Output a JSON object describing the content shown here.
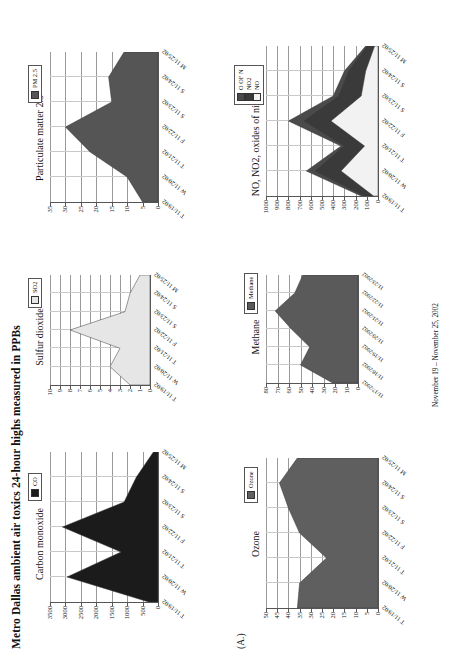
{
  "document": {
    "title": "Metro Dallas ambient air toxics 24-hour highs measured in PPBs",
    "panel_letter": "(A.)",
    "footer": "November 19 – November 25, 2002"
  },
  "colors": {
    "co_fill": "#1b1b1b",
    "so2_fill": "#e6e6e6",
    "ozone_fill": "#5f5f5f",
    "pm25_fill": "#555555",
    "methane_fill": "#5a5a5a",
    "methane_band": "#d9d9d9",
    "nox_o_of_n": "#4a4a4a",
    "nox_no2": "#3a3a3a",
    "nox_no": "#f2f2f2",
    "axis": "#555555",
    "grid": "#9a9a9a"
  },
  "dates_short": [
    "T 11/19/02",
    "W 11/20/02",
    "T 11/21/02",
    "F 11/22/02",
    "S 11/23/02",
    "S 11/24/02",
    "M 11/25/02"
  ],
  "dates_long": [
    "11/17/2002",
    "11/18/2002",
    "11/19/2002",
    "11/20/2002",
    "11/21/2002",
    "11/22/2002",
    "11/23/2002"
  ],
  "chart_data": [
    {
      "id": "carbon-monoxide",
      "type": "area",
      "title": "Carbon monoxide",
      "legend": [
        "CO"
      ],
      "categories": [
        "T 11/19/02",
        "W 11/20/02",
        "T 11/21/02",
        "F 11/22/02",
        "S 11/23/02",
        "S 11/24/02",
        "M 11/25/02"
      ],
      "series": [
        {
          "name": "CO",
          "values": [
            300,
            2950,
            1200,
            3100,
            1100,
            700,
            150
          ]
        }
      ],
      "ylim": [
        0,
        3500
      ],
      "yticks": [
        0,
        500,
        1000,
        1500,
        2000,
        2500,
        3000,
        3500
      ],
      "xlabel": "",
      "ylabel": "",
      "grid": true,
      "legend_position": "top-right"
    },
    {
      "id": "sulfur-dioxide",
      "type": "area",
      "title": "Sulfur dioxide",
      "legend": [
        "SO2"
      ],
      "categories": [
        "T 11/19/02",
        "W 11/20/02",
        "T 11/21/02",
        "F 11/22/02",
        "S 11/23/02",
        "S 11/24/02",
        "M 11/25/02"
      ],
      "series": [
        {
          "name": "SO2",
          "values": [
            2.0,
            4.0,
            3.0,
            8.0,
            2.5,
            2.0,
            1.0
          ]
        }
      ],
      "ylim": [
        0,
        10
      ],
      "yticks": [
        0,
        1,
        2,
        3,
        4,
        5,
        6,
        7,
        8,
        9,
        10
      ],
      "xlabel": "",
      "ylabel": "",
      "grid": true,
      "legend_position": "top-right"
    },
    {
      "id": "ozone",
      "type": "area",
      "title": "Ozone",
      "legend": [
        "Ozone"
      ],
      "categories": [
        "T 11/19/02",
        "W 11/20/02",
        "T 11/21/02",
        "F 11/22/02",
        "S 11/23/02",
        "S 11/24/02",
        "M 11/25/02"
      ],
      "series": [
        {
          "name": "Ozone",
          "values": [
            36,
            35,
            23,
            35,
            40,
            44,
            36
          ]
        }
      ],
      "ylim": [
        0,
        50
      ],
      "yticks": [
        0,
        5,
        10,
        15,
        20,
        25,
        30,
        35,
        40,
        45,
        50
      ],
      "xlabel": "",
      "ylabel": "",
      "grid": true,
      "legend_position": "top-right"
    },
    {
      "id": "particulate-matter-25",
      "type": "area",
      "title": "Particulate matter 2.5",
      "legend": [
        "PM 2.5"
      ],
      "categories": [
        "T 11/19/02",
        "W 11/20/02",
        "T 11/21/02",
        "F 11/22/02",
        "S 11/23/02",
        "S 11/24/02",
        "M 11/25/02"
      ],
      "series": [
        {
          "name": "PM 2.5",
          "values": [
            5,
            10,
            22,
            30,
            15,
            16,
            11
          ]
        }
      ],
      "ylim": [
        0,
        35
      ],
      "yticks": [
        0,
        5,
        10,
        15,
        20,
        25,
        30,
        35
      ],
      "xlabel": "",
      "ylabel": "",
      "grid": true,
      "legend_position": "top-right"
    },
    {
      "id": "methane",
      "type": "area",
      "title": "Methane",
      "legend": [
        "Methane"
      ],
      "categories": [
        "11/17/2002",
        "11/18/2002",
        "11/19/2002",
        "11/20/2002",
        "11/21/2002",
        "11/22/2002",
        "11/23/2002"
      ],
      "series": [
        {
          "name": "Methane",
          "values": [
            22,
            50,
            42,
            58,
            72,
            55,
            48
          ]
        }
      ],
      "ylim": [
        0,
        80
      ],
      "yticks": [
        0,
        10,
        20,
        30,
        40,
        50,
        60,
        70,
        80
      ],
      "xlabel": "",
      "ylabel": "",
      "grid": true,
      "legend_position": "top-right"
    },
    {
      "id": "nox",
      "type": "area",
      "title": "NO, NO2, oxides of nitrogen",
      "legend": [
        "O OF N",
        "NO2",
        "NO"
      ],
      "categories": [
        "T 11/19/02",
        "W 11/20/02",
        "T 11/21/02",
        "F 11/22/02",
        "S 11/23/02",
        "S 11/24/02",
        "M 11/25/02"
      ],
      "series": [
        {
          "name": "O OF N",
          "values": [
            150,
            640,
            330,
            800,
            400,
            300,
            110
          ]
        },
        {
          "name": "NO2",
          "values": [
            120,
            560,
            300,
            660,
            350,
            260,
            95
          ]
        },
        {
          "name": "NO",
          "values": [
            40,
            330,
            120,
            420,
            150,
            110,
            30
          ]
        }
      ],
      "ylim": [
        0,
        1000
      ],
      "yticks": [
        0,
        100,
        200,
        300,
        400,
        500,
        600,
        700,
        800,
        900,
        1000
      ],
      "xlabel": "",
      "ylabel": "",
      "grid": true,
      "legend_position": "top-right"
    }
  ]
}
